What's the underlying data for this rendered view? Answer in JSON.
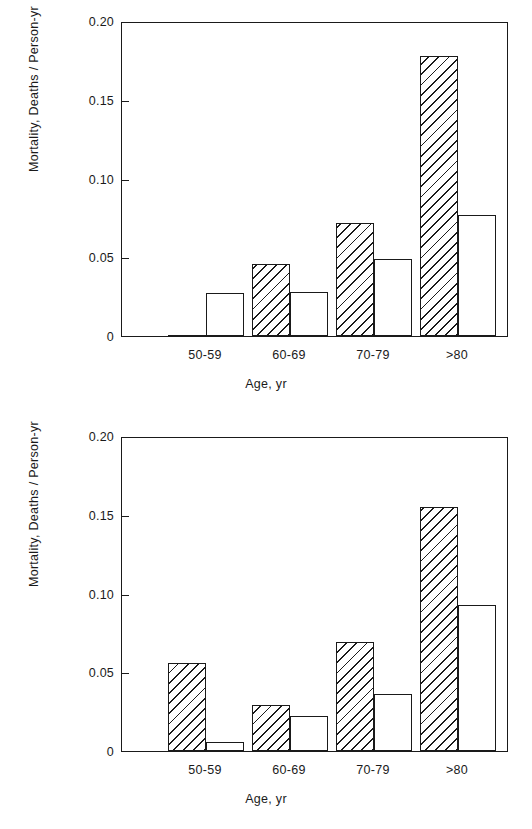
{
  "chart_data": [
    {
      "id": "top",
      "type": "bar",
      "title": "",
      "xlabel": "Age, yr",
      "ylabel": "Mortality, Deaths / Person-yr",
      "categories": [
        "50-59",
        "60-69",
        "70-79",
        ">80"
      ],
      "ylim": [
        0,
        0.2
      ],
      "ytick_values": [
        0,
        0.05,
        0.1,
        0.15,
        0.2
      ],
      "ytick_labels": [
        "0",
        "0.05",
        "0.10",
        "0.15",
        "0.20"
      ],
      "grid": false,
      "legend": "none",
      "series": [
        {
          "name": "hatched",
          "style": "diagonal-hatch",
          "values": [
            0.0,
            0.046,
            0.072,
            0.178
          ]
        },
        {
          "name": "open",
          "style": "open-white",
          "values": [
            0.027,
            0.028,
            0.049,
            0.077
          ]
        }
      ]
    },
    {
      "id": "bottom",
      "type": "bar",
      "title": "",
      "xlabel": "Age, yr",
      "ylabel": "Mortality, Deaths / Person-yr",
      "categories": [
        "50-59",
        "60-69",
        "70-79",
        ">80"
      ],
      "ylim": [
        0,
        0.2
      ],
      "ytick_values": [
        0,
        0.05,
        0.1,
        0.15,
        0.2
      ],
      "ytick_labels": [
        "0",
        "0.05",
        "0.10",
        "0.15",
        "0.20"
      ],
      "grid": false,
      "legend": "none",
      "series": [
        {
          "name": "hatched",
          "style": "diagonal-hatch",
          "values": [
            0.056,
            0.029,
            0.069,
            0.155
          ]
        },
        {
          "name": "open",
          "style": "open-white",
          "values": [
            0.006,
            0.022,
            0.036,
            0.093
          ]
        }
      ]
    }
  ],
  "colors": {
    "ink": "#1a1a1a",
    "background": "#ffffff"
  }
}
